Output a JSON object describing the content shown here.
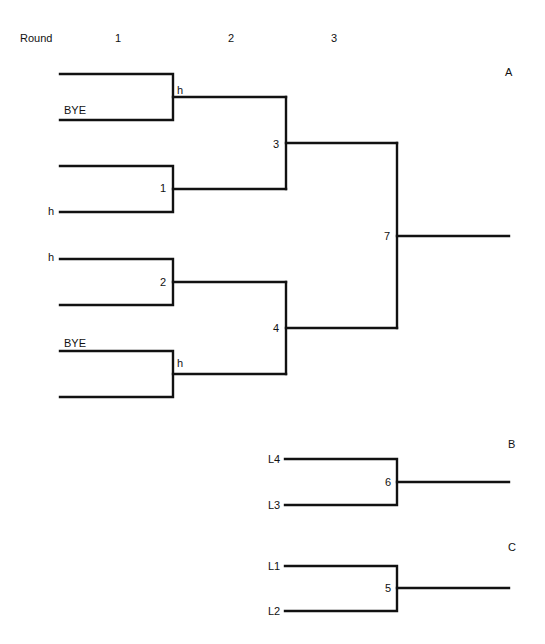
{
  "header": {
    "round_label": "Round",
    "rounds": [
      "1",
      "2",
      "3"
    ]
  },
  "brackets": {
    "A": {
      "label": "A",
      "round1": {
        "slots": [
          "",
          "BYE",
          "",
          "h",
          "h",
          "",
          "BYE",
          ""
        ],
        "games": [
          {
            "id": "h"
          },
          {
            "id": "1"
          },
          {
            "id": "2"
          },
          {
            "id": "h"
          }
        ]
      },
      "round2": {
        "games": [
          {
            "id": "3"
          },
          {
            "id": "4"
          }
        ]
      },
      "round3": {
        "games": [
          {
            "id": "7"
          }
        ]
      }
    },
    "B": {
      "label": "B",
      "slots": [
        "L4",
        "L3"
      ],
      "game": "6"
    },
    "C": {
      "label": "C",
      "slots": [
        "L1",
        "L2"
      ],
      "game": "5"
    }
  },
  "colors": {
    "line": "#111111",
    "background": "#ffffff"
  }
}
